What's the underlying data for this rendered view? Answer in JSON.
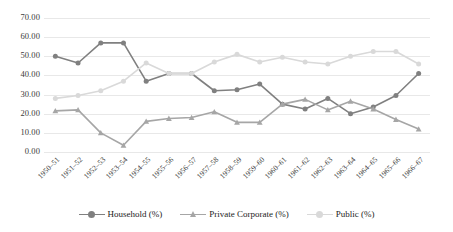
{
  "chart_data": {
    "type": "line",
    "title": "",
    "xlabel": "",
    "ylabel": "",
    "ylim": [
      0,
      70
    ],
    "yticks": [
      0,
      10,
      20,
      30,
      40,
      50,
      60,
      70
    ],
    "ytick_labels": [
      "0.00",
      "10.00",
      "20.00",
      "30.00",
      "40.00",
      "50.00",
      "60.00",
      "70.00"
    ],
    "grid": true,
    "legend_position": "bottom",
    "categories": [
      "1950–51",
      "1951–52",
      "1952–53",
      "1953–54",
      "1954–55",
      "1955–56",
      "1956–57",
      "1957–58",
      "1958–59",
      "1959–60",
      "1960–61",
      "1961–62",
      "1962–63",
      "1963–64",
      "1964–65",
      "1965–66",
      "1966–67"
    ],
    "series": [
      {
        "name": "Household (%)",
        "color": "#808080",
        "marker": "circle",
        "values": [
          50.0,
          46.5,
          57.0,
          57.0,
          37.0,
          41.0,
          41.0,
          32.0,
          32.5,
          35.5,
          25.0,
          22.5,
          28.0,
          20.0,
          23.5,
          29.5,
          41.0
        ]
      },
      {
        "name": "Private Corporate (%)",
        "color": "#a6a6a6",
        "marker": "triangle",
        "values": [
          21.5,
          22.0,
          10.0,
          3.5,
          16.0,
          17.5,
          18.0,
          21.0,
          15.5,
          15.5,
          25.0,
          27.5,
          22.0,
          26.5,
          22.5,
          17.0,
          12.0
        ]
      },
      {
        "name": "Public (%)",
        "color": "#d9d9d9",
        "marker": "circle",
        "values": [
          28.0,
          29.5,
          32.0,
          37.0,
          46.5,
          41.0,
          41.0,
          47.0,
          51.0,
          47.0,
          49.5,
          47.0,
          46.0,
          50.0,
          52.5,
          52.5,
          46.0
        ]
      }
    ]
  },
  "legend": {
    "items": [
      {
        "label": "Household (%)"
      },
      {
        "label": "Private Corporate (%)"
      },
      {
        "label": "Public (%)"
      }
    ]
  }
}
